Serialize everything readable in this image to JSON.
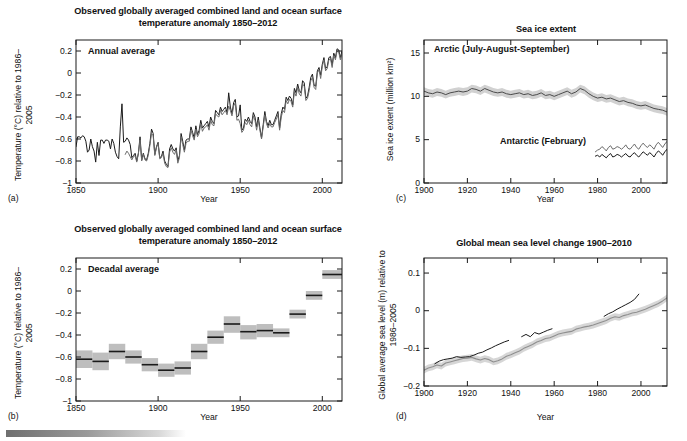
{
  "figure": {
    "caption_bar": "decorative-gradient-bar"
  },
  "panels": [
    {
      "id": "a",
      "label": "(a)",
      "title": "Observed globally averaged combined land and ocean surface temperature anomaly 1850–2012",
      "inset_label": "Annual average",
      "xlabel": "Year",
      "ylabel": "Temperature (°C) relative to 1986–2005",
      "xticks": [
        "1850",
        "1900",
        "1950",
        "2000"
      ],
      "yticks": [
        "0.2",
        "0",
        "−0.2",
        "−0.4",
        "−0.6",
        "−0.8",
        "−1"
      ]
    },
    {
      "id": "b",
      "label": "(b)",
      "title": "Observed globally averaged combined land and ocean surface temperature anomaly 1850–2012",
      "inset_label": "Decadal average",
      "xlabel": "Year",
      "ylabel": "Temperature (°C) relative to 1986–2005",
      "xticks": [
        "1850",
        "1900",
        "1950",
        "2000"
      ],
      "yticks": [
        "0.2",
        "0",
        "−0.2",
        "−0.4",
        "−0.6",
        "−0.8",
        "−1"
      ]
    },
    {
      "id": "c",
      "label": "(c)",
      "title": "Sea ice extent",
      "inset_label": "Arctic (July-August-September)",
      "inset_label2": "Antarctic (February)",
      "xlabel": "Year",
      "ylabel": "Sea ice extent (million km²)",
      "xticks": [
        "1900",
        "1920",
        "1940",
        "1960",
        "1980",
        "2000"
      ],
      "yticks": [
        "15",
        "10",
        "5",
        "0"
      ]
    },
    {
      "id": "d",
      "label": "(d)",
      "title": "Global mean sea level change 1900–2010",
      "xlabel": "Year",
      "ylabel": "Global average sea level (m) relative to 1986–2005",
      "xticks": [
        "1900",
        "1920",
        "1940",
        "1960",
        "1980",
        "2000"
      ],
      "yticks": [
        "0.1",
        "0",
        "−0.1",
        "−0.2"
      ]
    }
  ],
  "colors": {
    "line_dark": "#1a1a1a",
    "line_mid": "#6b6b6b",
    "band_light": "#c9c9c9",
    "band_mid": "#a8a8a8",
    "frame": "#1a1a1a",
    "background": "#ffffff"
  },
  "chart_data": [
    {
      "panel": "a",
      "type": "line",
      "title": "Observed globally averaged combined land and ocean surface temperature anomaly 1850–2012",
      "annotation": "Annual average",
      "xlabel": "Year",
      "ylabel": "Temperature (°C) relative to 1986–2005",
      "xlim": [
        1850,
        2012
      ],
      "ylim": [
        -1,
        0.3
      ],
      "ytick_values": [
        0.2,
        0,
        -0.2,
        -0.4,
        -0.6,
        -0.8,
        -1
      ],
      "xtick_values": [
        1850,
        1900,
        1950,
        2000
      ],
      "grid": false,
      "legend": "none",
      "series": [
        {
          "name": "HadCRUT4 (black)",
          "color": "#1a1a1a",
          "x_start": 1850,
          "x_step": 1,
          "values": [
            -0.67,
            -0.58,
            -0.58,
            -0.59,
            -0.57,
            -0.58,
            -0.62,
            -0.72,
            -0.7,
            -0.6,
            -0.67,
            -0.71,
            -0.81,
            -0.63,
            -0.75,
            -0.61,
            -0.61,
            -0.64,
            -0.61,
            -0.61,
            -0.62,
            -0.69,
            -0.6,
            -0.64,
            -0.72,
            -0.76,
            -0.78,
            -0.49,
            -0.28,
            -0.63,
            -0.62,
            -0.59,
            -0.61,
            -0.65,
            -0.77,
            -0.75,
            -0.73,
            -0.8,
            -0.73,
            -0.58,
            -0.79,
            -0.73,
            -0.78,
            -0.79,
            -0.73,
            -0.64,
            -0.51,
            -0.55,
            -0.74,
            -0.67,
            -0.63,
            -0.77,
            -0.76,
            -0.71,
            -0.8,
            -0.83,
            -0.85,
            -0.69,
            -0.65,
            -0.69,
            -0.71,
            -0.68,
            -0.8,
            -0.75,
            -0.55,
            -0.62,
            -0.7,
            -0.61,
            -0.6,
            -0.6,
            -0.49,
            -0.54,
            -0.59,
            -0.48,
            -0.56,
            -0.52,
            -0.43,
            -0.5,
            -0.48,
            -0.46,
            -0.44,
            -0.49,
            -0.4,
            -0.44,
            -0.46,
            -0.34,
            -0.36,
            -0.38,
            -0.31,
            -0.35,
            -0.33,
            -0.31,
            -0.36,
            -0.18,
            -0.31,
            -0.37,
            -0.27,
            -0.24,
            -0.4,
            -0.39,
            -0.29,
            -0.52,
            -0.5,
            -0.42,
            -0.44,
            -0.4,
            -0.44,
            -0.46,
            -0.36,
            -0.4,
            -0.49,
            -0.4,
            -0.5,
            -0.59,
            -0.47,
            -0.35,
            -0.44,
            -0.48,
            -0.43,
            -0.47,
            -0.47,
            -0.43,
            -0.39,
            -0.35,
            -0.5,
            -0.37,
            -0.31,
            -0.33,
            -0.22,
            -0.25,
            -0.21,
            -0.23,
            -0.29,
            -0.14,
            -0.18,
            -0.1,
            -0.16,
            -0.18,
            -0.07,
            -0.09,
            -0.23,
            -0.21,
            -0.13,
            -0.04,
            -0.01,
            -0.11,
            -0.12,
            0.02,
            0.05,
            -0.02,
            0.08,
            0.14,
            0.04,
            0.06,
            0.14,
            0.15,
            0.07,
            0.18,
            0.14,
            0.22,
            0.21,
            0.14,
            0.2
          ]
        },
        {
          "name": "Alternative dataset (grey)",
          "color": "#6b6b6b",
          "x_start": 1880,
          "x_step": 1,
          "values": [
            -0.74,
            -0.71,
            -0.73,
            -0.76,
            -0.79,
            -0.76,
            -0.75,
            -0.81,
            -0.73,
            -0.61,
            -0.8,
            -0.74,
            -0.79,
            -0.8,
            -0.75,
            -0.66,
            -0.55,
            -0.57,
            -0.75,
            -0.68,
            -0.64,
            -0.78,
            -0.77,
            -0.73,
            -0.82,
            -0.85,
            -0.86,
            -0.72,
            -0.68,
            -0.72,
            -0.74,
            -0.7,
            -0.82,
            -0.77,
            -0.58,
            -0.65,
            -0.72,
            -0.64,
            -0.62,
            -0.62,
            -0.52,
            -0.57,
            -0.61,
            -0.51,
            -0.58,
            -0.55,
            -0.46,
            -0.53,
            -0.5,
            -0.49,
            -0.47,
            -0.52,
            -0.43,
            -0.47,
            -0.48,
            -0.37,
            -0.39,
            -0.4,
            -0.34,
            -0.38,
            -0.36,
            -0.34,
            -0.38,
            -0.3,
            -0.34,
            -0.39,
            -0.3,
            -0.27,
            -0.43,
            -0.42,
            -0.46,
            -0.54,
            -0.52,
            -0.45,
            -0.47,
            -0.43,
            -0.47,
            -0.49,
            -0.39,
            -0.43,
            -0.52,
            -0.43,
            -0.52,
            -0.6,
            -0.49,
            -0.38,
            -0.46,
            -0.5,
            -0.46,
            -0.49,
            -0.49,
            -0.45,
            -0.42,
            -0.38,
            -0.52,
            -0.4,
            -0.34,
            -0.36,
            -0.25,
            -0.28,
            -0.24,
            -0.26,
            -0.31,
            -0.17,
            -0.21,
            -0.13,
            -0.19,
            -0.21,
            -0.1,
            -0.12,
            -0.25,
            -0.23,
            -0.16,
            -0.07,
            -0.04,
            -0.13,
            -0.15,
            0.0,
            0.03,
            -0.05,
            0.06,
            0.12,
            0.02,
            0.04,
            0.12,
            0.13,
            0.05,
            0.16,
            0.12,
            0.2,
            0.19,
            0.12,
            0.18
          ]
        }
      ]
    },
    {
      "panel": "b",
      "type": "bar",
      "title": "Observed globally averaged combined land and ocean surface temperature anomaly 1850–2012",
      "annotation": "Decadal average",
      "xlabel": "Year",
      "ylabel": "Temperature (°C) relative to 1986–2005",
      "xlim": [
        1850,
        2012
      ],
      "ylim": [
        -1,
        0.3
      ],
      "ytick_values": [
        0.2,
        0,
        -0.2,
        -0.4,
        -0.6,
        -0.8,
        -1
      ],
      "xtick_values": [
        1850,
        1900,
        1950,
        2000
      ],
      "grid": false,
      "legend": "none",
      "decades": [
        {
          "start": 1850,
          "end": 1860,
          "value": -0.62,
          "lo": -0.7,
          "hi": -0.54
        },
        {
          "start": 1860,
          "end": 1870,
          "value": -0.64,
          "lo": -0.72,
          "hi": -0.56
        },
        {
          "start": 1870,
          "end": 1880,
          "value": -0.55,
          "lo": -0.62,
          "hi": -0.48
        },
        {
          "start": 1880,
          "end": 1890,
          "value": -0.6,
          "lo": -0.66,
          "hi": -0.54
        },
        {
          "start": 1890,
          "end": 1900,
          "value": -0.67,
          "lo": -0.73,
          "hi": -0.61
        },
        {
          "start": 1900,
          "end": 1910,
          "value": -0.72,
          "lo": -0.78,
          "hi": -0.66
        },
        {
          "start": 1910,
          "end": 1920,
          "value": -0.7,
          "lo": -0.76,
          "hi": -0.64
        },
        {
          "start": 1920,
          "end": 1930,
          "value": -0.55,
          "lo": -0.62,
          "hi": -0.48
        },
        {
          "start": 1930,
          "end": 1940,
          "value": -0.42,
          "lo": -0.48,
          "hi": -0.36
        },
        {
          "start": 1940,
          "end": 1950,
          "value": -0.3,
          "lo": -0.38,
          "hi": -0.23
        },
        {
          "start": 1950,
          "end": 1960,
          "value": -0.37,
          "lo": -0.44,
          "hi": -0.31
        },
        {
          "start": 1960,
          "end": 1970,
          "value": -0.36,
          "lo": -0.42,
          "hi": -0.3
        },
        {
          "start": 1970,
          "end": 1980,
          "value": -0.38,
          "lo": -0.42,
          "hi": -0.34
        },
        {
          "start": 1980,
          "end": 1990,
          "value": -0.21,
          "lo": -0.25,
          "hi": -0.17
        },
        {
          "start": 1990,
          "end": 2000,
          "value": -0.04,
          "lo": -0.08,
          "hi": 0.0
        },
        {
          "start": 2000,
          "end": 2012,
          "value": 0.15,
          "lo": 0.11,
          "hi": 0.19
        }
      ]
    },
    {
      "panel": "c",
      "type": "line",
      "title": "Sea ice extent",
      "annotations": [
        "Arctic (July-August-September)",
        "Antarctic (February)"
      ],
      "xlabel": "Year",
      "ylabel": "Sea ice extent (million km²)",
      "xlim": [
        1900,
        2012
      ],
      "ylim": [
        0,
        16.5
      ],
      "ytick_values": [
        15,
        10,
        5,
        0
      ],
      "xtick_values": [
        1900,
        1920,
        1940,
        1960,
        1980,
        2000
      ],
      "grid": false,
      "legend": "none",
      "series": [
        {
          "name": "Arctic JAS sea ice extent",
          "color": "#4a4a4a",
          "band_color": "#c9c9c9",
          "x_start": 1900,
          "x_step": 2,
          "values": [
            10.6,
            10.4,
            10.3,
            10.5,
            10.4,
            10.2,
            10.4,
            10.5,
            10.6,
            10.5,
            10.6,
            10.9,
            10.8,
            10.6,
            10.9,
            10.7,
            10.5,
            10.4,
            10.5,
            10.3,
            10.2,
            10.3,
            10.4,
            10.2,
            10.3,
            10.1,
            10.2,
            10.4,
            10.1,
            10.2,
            10.0,
            10.2,
            10.4,
            10.6,
            10.3,
            10.5,
            10.9,
            10.7,
            10.3,
            10.0,
            9.8,
            9.9,
            9.7,
            9.8,
            9.6,
            9.4,
            9.5,
            9.3,
            9.2,
            9.0,
            8.9,
            9.0,
            8.8,
            8.6,
            8.5,
            8.4,
            8.2,
            8.0,
            8.1,
            7.8,
            7.5,
            7.6,
            7.2,
            6.9,
            6.3,
            5.9,
            5.5
          ],
          "band_half_width": 0.45
        },
        {
          "name": "Antarctic February sea ice extent (lower)",
          "color": "#1a1a1a",
          "x_start": 1979,
          "x_step": 1,
          "values": [
            3.1,
            3.2,
            3.0,
            3.3,
            3.1,
            2.9,
            3.2,
            3.4,
            3.0,
            3.1,
            3.3,
            3.2,
            3.0,
            3.2,
            3.4,
            3.1,
            3.0,
            3.3,
            3.5,
            3.2,
            3.0,
            3.3,
            3.6,
            3.4,
            3.2,
            3.5,
            3.3,
            3.0,
            3.4,
            3.7,
            3.5,
            3.2,
            3.6,
            3.9,
            2.8
          ]
        },
        {
          "name": "Antarctic February sea ice extent (upper)",
          "color": "#6b6b6b",
          "x_start": 1979,
          "x_step": 1,
          "values": [
            3.6,
            3.8,
            3.9,
            4.2,
            4.0,
            3.7,
            4.1,
            4.3,
            3.9,
            4.0,
            4.2,
            4.1,
            3.9,
            4.1,
            4.4,
            4.0,
            3.9,
            4.2,
            4.5,
            4.1,
            3.9,
            4.3,
            4.6,
            4.3,
            4.1,
            4.4,
            4.2,
            3.9,
            4.4,
            4.7,
            4.4,
            4.1,
            4.5,
            4.8,
            3.9
          ]
        }
      ]
    },
    {
      "panel": "d",
      "type": "line",
      "title": "Global mean sea level change 1900–2010",
      "xlabel": "Year",
      "ylabel": "Global average sea level (m) relative to 1986–2005",
      "xlim": [
        1900,
        2012
      ],
      "ylim": [
        -0.2,
        0.14
      ],
      "ytick_values": [
        0.1,
        0,
        -0.1,
        -0.2
      ],
      "xtick_values": [
        1900,
        1920,
        1940,
        1960,
        1980,
        2000
      ],
      "grid": false,
      "legend": "none",
      "series": [
        {
          "name": "Reconstruction 1 (grey, with band)",
          "color": "#8f8f8f",
          "band_color": "#cfcfcf",
          "x_start": 1900,
          "x_step": 2,
          "values": [
            -0.158,
            -0.152,
            -0.149,
            -0.144,
            -0.147,
            -0.139,
            -0.136,
            -0.133,
            -0.13,
            -0.127,
            -0.126,
            -0.124,
            -0.128,
            -0.131,
            -0.127,
            -0.13,
            -0.136,
            -0.133,
            -0.128,
            -0.121,
            -0.117,
            -0.112,
            -0.107,
            -0.1,
            -0.095,
            -0.09,
            -0.083,
            -0.079,
            -0.074,
            -0.072,
            -0.067,
            -0.062,
            -0.059,
            -0.057,
            -0.055,
            -0.049,
            -0.046,
            -0.043,
            -0.041,
            -0.038,
            -0.034,
            -0.03,
            -0.026,
            -0.02,
            -0.016,
            -0.018,
            -0.013,
            -0.01,
            -0.006,
            -0.004,
            0.0,
            0.004,
            0.009,
            0.014,
            0.019,
            0.026,
            0.034,
            0.04
          ],
          "band_half_width": 0.009
        },
        {
          "name": "Tide gauge record (black)",
          "color": "#1a1a1a",
          "x_start": 1905,
          "x_step": 2,
          "values": [
            -0.141,
            -0.134,
            -0.13,
            -0.128,
            -0.126,
            -0.122,
            -0.124,
            -0.123,
            -0.122,
            -0.118,
            -0.113,
            -0.11,
            -0.104,
            -0.099,
            -0.093,
            -0.088,
            -0.083,
            -0.079,
            null,
            null,
            -0.069,
            -0.063,
            -0.069,
            -0.058,
            -0.062,
            -0.057,
            -0.052,
            -0.048,
            null,
            null,
            null,
            null,
            null,
            null,
            null,
            null,
            null,
            null,
            null,
            -0.015,
            -0.008,
            -0.003,
            0.004,
            0.01,
            0.016,
            0.022,
            0.03,
            0.044
          ]
        }
      ]
    }
  ]
}
